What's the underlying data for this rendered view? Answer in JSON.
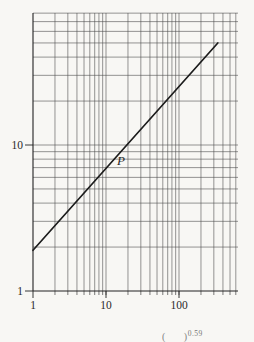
{
  "chart_data": {
    "type": "line",
    "scale": "log-log",
    "title": "",
    "xlabel": "",
    "ylabel": "",
    "x_axis": {
      "range": [
        1,
        600
      ],
      "tick_labels": [
        "1",
        "10",
        "100"
      ],
      "tick_values": [
        1,
        10,
        100
      ],
      "gridlines": [
        2,
        3,
        4,
        5,
        6,
        7,
        8,
        9,
        10,
        20,
        30,
        40,
        50,
        60,
        70,
        80,
        90,
        100,
        200,
        300,
        400,
        500,
        600
      ]
    },
    "y_axis": {
      "range": [
        1,
        80
      ],
      "tick_labels": [
        "1",
        "10"
      ],
      "tick_values": [
        1,
        10
      ],
      "gridlines": [
        2,
        3,
        4,
        5,
        6,
        7,
        8,
        9,
        10,
        20,
        30,
        40,
        50,
        60,
        70,
        80
      ]
    },
    "grid": "full log-log graph paper, all minor lines drawn",
    "legend": "none",
    "series": [
      {
        "name": "power-law-line",
        "points": [
          [
            1,
            1.9
          ],
          [
            340,
            50
          ]
        ],
        "exponent_label": "0.59",
        "description": "single straight line on log-log axes from (1, ~1.9) to (~340, ~50)"
      }
    ],
    "point_label": {
      "text": "P",
      "x": 16,
      "y": 7.8
    },
    "caption": {
      "base": "(      )",
      "exponent": "0.59"
    }
  },
  "colors": {
    "background": "#f8f7f4",
    "grid": "#4f4f4f",
    "axis": "#222222",
    "line": "#1c1c1c",
    "text": "#2a2a2a"
  }
}
